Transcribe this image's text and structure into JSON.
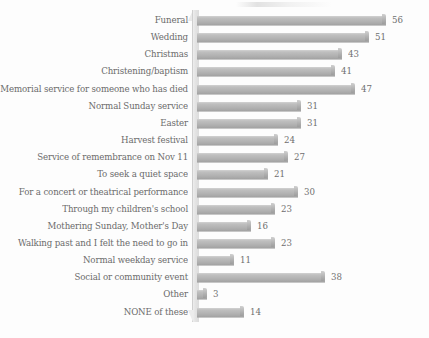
{
  "chart_data": {
    "type": "bar",
    "orientation": "horizontal",
    "title": "",
    "subtitle": "",
    "xlabel": "",
    "ylabel": "",
    "grid": false,
    "legend": null,
    "value_labels_shown": true,
    "xlim": [
      0,
      56
    ],
    "categories": [
      "Funeral",
      "Wedding",
      "Christmas",
      "Christening/baptism",
      "Memorial service for someone who has died",
      "Normal Sunday service",
      "Easter",
      "Harvest festival",
      "Service of remembrance on Nov 11",
      "To seek a quiet space",
      "For a concert or theatrical performance",
      "Through my children's school",
      "Mothering Sunday, Mother's Day",
      "Walking past and I felt the need to go in",
      "Normal weekday service",
      "Social or community event",
      "Other",
      "NONE of these"
    ],
    "values": [
      56,
      51,
      43,
      41,
      47,
      31,
      31,
      24,
      27,
      21,
      30,
      23,
      16,
      23,
      11,
      38,
      3,
      14
    ]
  },
  "style": {
    "bar_color": "#b4b4b4",
    "bar_edge_color": "#9d9d9d",
    "wall_color": "#e4e4e4",
    "text_color": "#6b6b6b",
    "background": "#fdfdfd"
  }
}
